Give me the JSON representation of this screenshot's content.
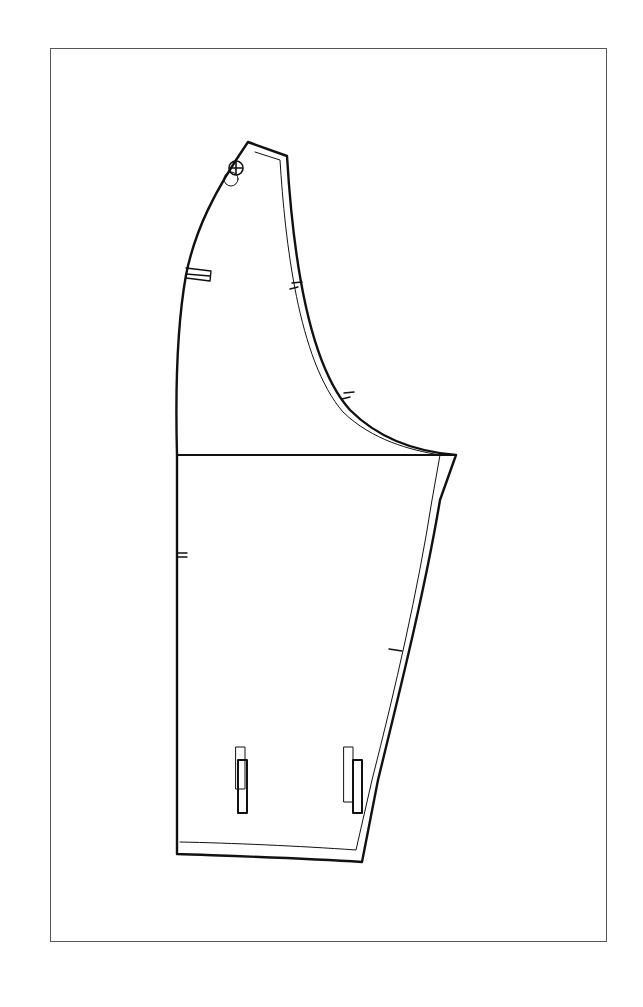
{
  "diagram": {
    "type": "sewing-pattern-piece",
    "colors": {
      "line": "#111111",
      "frame": "#555555",
      "background": "#ffffff"
    },
    "elements": {
      "frame": "outer border rectangle",
      "sleeve_cap": "curved sleeve head",
      "bicep_line": "horizontal underarm line",
      "seam_allowance": "inner parallel offset line",
      "notches": [
        "cap notch 1",
        "cap notch 2",
        "underarm seam notch",
        "elbow notch",
        "left seam double notch"
      ],
      "buttons": "two stacked circle markings at shoulder point",
      "placement_marks": [
        "left rectangle marker",
        "cuff vent marker left",
        "cuff vent marker right"
      ]
    }
  }
}
